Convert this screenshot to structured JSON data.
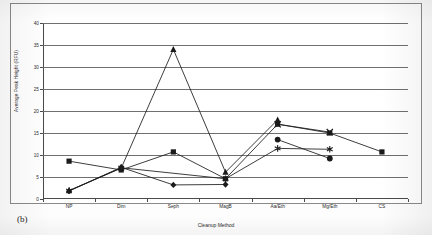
{
  "figure": {
    "panel_label": "(b)",
    "xlabel": "Cleanup Method",
    "ylabel": "Average Peak Height (RFU)"
  },
  "axis": {
    "y_ticks": [
      "0",
      "5",
      "10",
      "15",
      "20",
      "25",
      "30",
      "35",
      "40"
    ],
    "x_ticks": [
      "NP",
      "Dim",
      "Seph",
      "MagB",
      "Aa/Eth",
      "Mg/Eth",
      "CS"
    ]
  },
  "chart_data": {
    "type": "line",
    "title": "",
    "xlabel": "Cleanup Method",
    "ylabel": "Average Peak Height (RFU)",
    "categories": [
      "NP",
      "Dim",
      "Seph",
      "MagB",
      "Aa/Eth",
      "Mg/Eth",
      "CS"
    ],
    "ylim": [
      0,
      40
    ],
    "ytick_step": 5,
    "grid": true,
    "legend": "none",
    "series": [
      {
        "name": "series-square",
        "marker": "square",
        "values": [
          8.6,
          6.6,
          10.7,
          4.6,
          17.0,
          15.0,
          10.7
        ]
      },
      {
        "name": "series-diamond",
        "marker": "diamond",
        "values": [
          1.8,
          7.2,
          3.2,
          3.3,
          null,
          null,
          null
        ]
      },
      {
        "name": "series-triangle",
        "marker": "triangle",
        "values": [
          1.9,
          7.0,
          34.0,
          6.1,
          18.0,
          null,
          null
        ]
      },
      {
        "name": "series-x",
        "marker": "x",
        "values": [
          null,
          null,
          null,
          null,
          17.0,
          15.2,
          null
        ]
      },
      {
        "name": "series-star",
        "marker": "star",
        "values": [
          1.9,
          7.1,
          null,
          4.6,
          11.5,
          11.3,
          null
        ]
      },
      {
        "name": "series-circle",
        "marker": "circle",
        "values": [
          null,
          null,
          null,
          null,
          13.5,
          9.2,
          null
        ]
      }
    ]
  }
}
